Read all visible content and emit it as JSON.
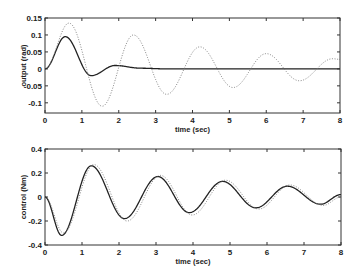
{
  "chart_data": [
    {
      "type": "line",
      "title": "",
      "xlabel": "time (sec)",
      "ylabel": "output (rad)",
      "xlim": [
        0,
        8
      ],
      "ylim": [
        -0.13,
        0.15
      ],
      "xticks": [
        0,
        1,
        2,
        3,
        4,
        5,
        6,
        7,
        8
      ],
      "yticks": [
        0.15,
        0.1,
        0.05,
        0,
        -0.05,
        -0.1
      ],
      "ytick_labels": [
        "0.15",
        "0.1",
        "0.05",
        "0",
        "-0.05",
        "-0.1"
      ],
      "grid": false,
      "legend": null,
      "series": [
        {
          "name": "solid",
          "style": "solid",
          "x": [
            0,
            0.55,
            1.25,
            1.9,
            2.6,
            3.3,
            8
          ],
          "y": [
            0,
            0.095,
            -0.02,
            0.01,
            0.002,
            0.0,
            0.0
          ]
        },
        {
          "name": "dotted",
          "style": "dotted",
          "x": [
            0,
            0.65,
            1.55,
            2.4,
            3.3,
            4.2,
            5.1,
            6.0,
            6.9,
            7.8,
            8
          ],
          "y": [
            0,
            0.135,
            -0.11,
            0.1,
            -0.075,
            0.065,
            -0.055,
            0.045,
            -0.035,
            0.03,
            0.028
          ]
        }
      ]
    },
    {
      "type": "line",
      "title": "",
      "xlabel": "time (sec)",
      "ylabel": "control (Nm)",
      "xlim": [
        0,
        8
      ],
      "ylim": [
        -0.4,
        0.4
      ],
      "xticks": [
        0,
        1,
        2,
        3,
        4,
        5,
        6,
        7,
        8
      ],
      "yticks": [
        0.4,
        0.2,
        0,
        -0.2,
        -0.4
      ],
      "ytick_labels": [
        "0.4",
        "0.2",
        "0",
        "-0.2",
        "-0.4"
      ],
      "grid": false,
      "legend": null,
      "series": [
        {
          "name": "solid",
          "style": "solid",
          "x": [
            0,
            0.45,
            1.25,
            2.15,
            3.05,
            3.9,
            4.8,
            5.7,
            6.55,
            7.45,
            8
          ],
          "y": [
            0,
            -0.32,
            0.26,
            -0.18,
            0.17,
            -0.13,
            0.13,
            -0.09,
            0.09,
            -0.06,
            0.02
          ]
        },
        {
          "name": "dotted",
          "style": "dotted",
          "x": [
            0,
            0.5,
            1.32,
            2.22,
            3.12,
            3.98,
            4.88,
            5.78,
            6.62,
            7.52,
            8
          ],
          "y": [
            0,
            -0.3,
            0.27,
            -0.2,
            0.18,
            -0.15,
            0.14,
            -0.1,
            0.1,
            -0.07,
            0.0
          ]
        }
      ]
    }
  ]
}
